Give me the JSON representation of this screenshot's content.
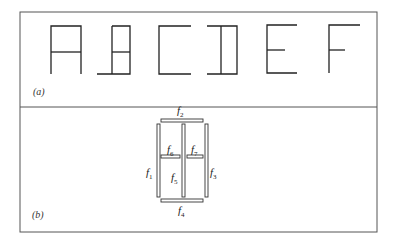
{
  "figure": {
    "panel_a": {
      "label": "(a)",
      "glyphs": [
        "A",
        "B",
        "C",
        "D",
        "E",
        "F"
      ]
    },
    "panel_b": {
      "label": "(b)",
      "segments": [
        {
          "id": "f1",
          "base": "f",
          "sub": "1",
          "orientation": "vertical",
          "position": "left"
        },
        {
          "id": "f2",
          "base": "f",
          "sub": "2",
          "orientation": "horizontal",
          "position": "top"
        },
        {
          "id": "f3",
          "base": "f",
          "sub": "3",
          "orientation": "vertical",
          "position": "right"
        },
        {
          "id": "f4",
          "base": "f",
          "sub": "4",
          "orientation": "horizontal",
          "position": "bottom"
        },
        {
          "id": "f5",
          "base": "f",
          "sub": "5",
          "orientation": "vertical",
          "position": "center"
        },
        {
          "id": "f6",
          "base": "f",
          "sub": "6",
          "orientation": "horizontal",
          "position": "middle-left"
        },
        {
          "id": "f7",
          "base": "f",
          "sub": "7",
          "orientation": "horizontal",
          "position": "middle-right"
        }
      ]
    }
  }
}
